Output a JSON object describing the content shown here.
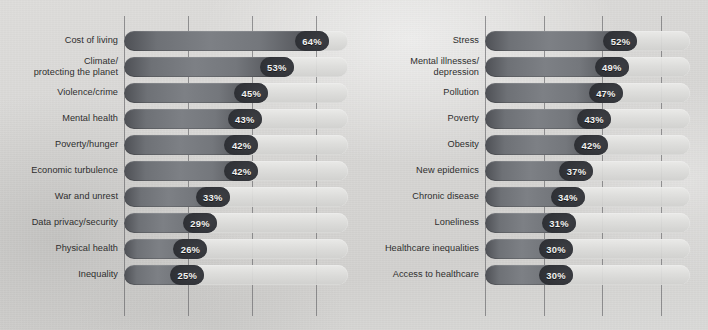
{
  "meta": {
    "accent_dark": "#303237",
    "bar_fill": "#74777c",
    "track_color": "#deded c",
    "label_color": "#2e2e2e",
    "value_text_color": "#f2f2f0",
    "background": "#d8d7d5",
    "top_clipped_text": ""
  },
  "chart_data": {
    "type": "bar",
    "title": "",
    "xlabel": "",
    "ylabel": "",
    "orientation": "horizontal",
    "value_suffix": "%",
    "xlim": [
      0,
      70
    ],
    "grid": true,
    "gridlines": [
      0,
      20,
      40,
      60
    ],
    "legend": "none",
    "panels": [
      {
        "name": "panel-left",
        "categories": [
          "Cost of living",
          "Climate/\nprotecting the planet",
          "Violence/crime",
          "Mental health",
          "Poverty/hunger",
          "Economic turbulence",
          "War and unrest",
          "Data privacy/security",
          "Physical health",
          "Inequality"
        ],
        "values": [
          64,
          53,
          45,
          43,
          42,
          42,
          33,
          29,
          26,
          25
        ],
        "labels": [
          "64%",
          "53%",
          "45%",
          "43%",
          "42%",
          "42%",
          "33%",
          "29%",
          "26%",
          "25%"
        ]
      },
      {
        "name": "panel-right",
        "categories": [
          "Stress",
          "Mental illnesses/\ndepression",
          "Pollution",
          "Poverty",
          "Obesity",
          "New epidemics",
          "Chronic disease",
          "Loneliness",
          "Healthcare inequalities",
          "Access to healthcare"
        ],
        "values": [
          52,
          49,
          47,
          43,
          42,
          37,
          34,
          31,
          30,
          30
        ],
        "labels": [
          "52%",
          "49%",
          "47%",
          "43%",
          "42%",
          "37%",
          "34%",
          "31%",
          "30%",
          "30%"
        ]
      }
    ]
  }
}
